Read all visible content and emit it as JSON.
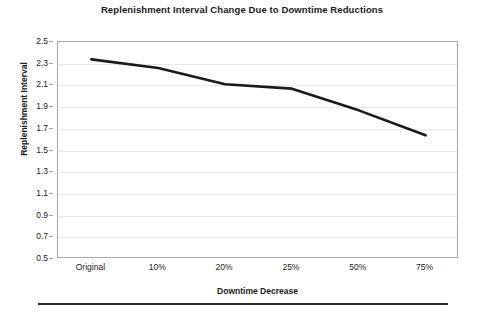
{
  "chart_data": {
    "type": "line",
    "title": "Replenishment Interval Change Due to Downtime Reductions",
    "xlabel": "Downtime Decrease",
    "ylabel": "Replenishment Interval",
    "categories": [
      "Original",
      "10%",
      "20%",
      "25%",
      "50%",
      "75%"
    ],
    "values": [
      2.34,
      2.26,
      2.11,
      2.07,
      1.87,
      1.64
    ],
    "ylim": [
      0.5,
      2.5
    ],
    "ytick_step": 0.2,
    "yticks": [
      "2.5",
      "2.3",
      "2.1",
      "1.9",
      "1.7",
      "1.5",
      "1.3",
      "1.1",
      "0.9",
      "0.7",
      "0.5"
    ],
    "grid": true,
    "grid_axis": "y",
    "legend": false,
    "legend_position": "none",
    "series": [
      {
        "name": "Replenishment Interval",
        "values": [
          2.34,
          2.26,
          2.11,
          2.07,
          1.87,
          1.64
        ],
        "color": "#1a1a1a",
        "line_width": 2.6,
        "markers": false
      }
    ]
  },
  "colors": {
    "line": "#1a1a1a",
    "grid": "#e9e9e9",
    "frame": "#a8a8a8",
    "text": "#1a1a1a",
    "rule": "#2b2b2b",
    "background": "#ffffff"
  }
}
